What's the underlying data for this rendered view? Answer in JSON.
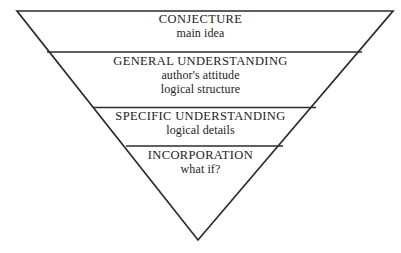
{
  "figure": {
    "name": "inverted-triangle-comprehension-funnel",
    "shape": "inverted-triangle",
    "background_color": "#ffffff",
    "line_color": "#2b2b2b",
    "text_color": "#1c1c1c"
  },
  "bands": [
    {
      "id": "conjecture",
      "title": "CONJECTURE",
      "sublines": [
        "main idea"
      ]
    },
    {
      "id": "general",
      "title": "GENERAL UNDERSTANDING",
      "sublines": [
        "author's attitude",
        "logical structure"
      ]
    },
    {
      "id": "specific",
      "title": "SPECIFIC UNDERSTANDING",
      "sublines": [
        "logical details"
      ]
    },
    {
      "id": "incorporation",
      "title": "INCORPORATION",
      "sublines": [
        "what if?"
      ]
    }
  ],
  "geometry": {
    "top_left": [
      17,
      11
    ],
    "top_right": [
      393,
      11
    ],
    "apex": [
      198,
      240
    ],
    "dividers_y": [
      52,
      107,
      146
    ]
  }
}
